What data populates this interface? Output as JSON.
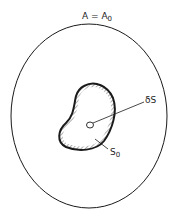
{
  "diagram": {
    "outer_region_label": "A = A",
    "outer_region_label_sub": "0",
    "inner_region_label": "S",
    "inner_region_label_sub": "0",
    "small_element_label": "δS",
    "colors": {
      "stroke": "#1a1a1a",
      "background": "#ffffff"
    }
  }
}
